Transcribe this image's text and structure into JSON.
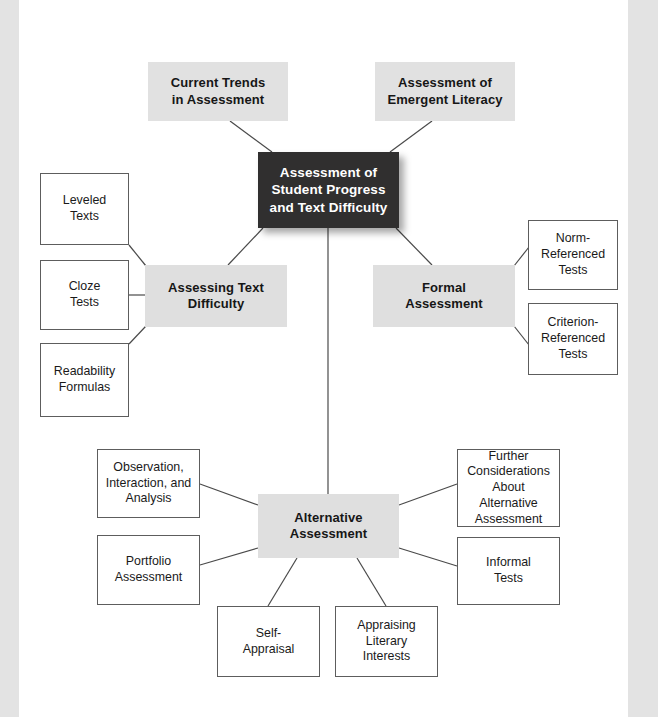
{
  "diagram": {
    "type": "concept-map",
    "colors": {
      "root_fill": "#302f2f",
      "root_text": "#ffffff",
      "hub_fill": "#dfdfdf",
      "top_fill": "#e1e1e1",
      "leaf_fill": "#ffffff",
      "leaf_border": "#5d5d5d",
      "connector": "#4a4a4a",
      "page_edge": "#e3e3e3"
    },
    "nodes": {
      "root": {
        "label": "Assessment of\nStudent Progress\nand Text Difficulty",
        "x": 258,
        "y": 152,
        "w": 141,
        "h": 76
      },
      "current_trends": {
        "label": "Current Trends\nin Assessment",
        "x": 148,
        "y": 62,
        "w": 140,
        "h": 59
      },
      "emergent_literacy": {
        "label": "Assessment of\nEmergent Literacy",
        "x": 375,
        "y": 62,
        "w": 140,
        "h": 59
      },
      "assessing_text_difficulty": {
        "label": "Assessing Text\nDifficulty",
        "x": 145,
        "y": 265,
        "w": 142,
        "h": 62
      },
      "formal_assessment": {
        "label": "Formal\nAssessment",
        "x": 373,
        "y": 265,
        "w": 142,
        "h": 62
      },
      "alternative_assessment": {
        "label": "Alternative\nAssessment",
        "x": 258,
        "y": 494,
        "w": 141,
        "h": 64
      },
      "leveled_texts": {
        "label": "Leveled\nTexts",
        "x": 40,
        "y": 173,
        "w": 89,
        "h": 72
      },
      "cloze_tests": {
        "label": "Cloze\nTests",
        "x": 40,
        "y": 260,
        "w": 89,
        "h": 70
      },
      "readability_formulas": {
        "label": "Readability\nFormulas",
        "x": 40,
        "y": 343,
        "w": 89,
        "h": 74
      },
      "norm_referenced_tests": {
        "label": "Norm-\nReferenced\nTests",
        "x": 528,
        "y": 220,
        "w": 90,
        "h": 70
      },
      "criterion_referenced_tests": {
        "label": "Criterion-\nReferenced\nTests",
        "x": 528,
        "y": 303,
        "w": 90,
        "h": 72
      },
      "observation_interaction_analysis": {
        "label": "Observation,\nInteraction, and\nAnalysis",
        "x": 97,
        "y": 449,
        "w": 103,
        "h": 69
      },
      "portfolio_assessment": {
        "label": "Portfolio\nAssessment",
        "x": 97,
        "y": 535,
        "w": 103,
        "h": 70
      },
      "self_appraisal": {
        "label": "Self-\nAppraisal",
        "x": 217,
        "y": 606,
        "w": 103,
        "h": 71
      },
      "appraising_literary_interests": {
        "label": "Appraising\nLiterary\nInterests",
        "x": 335,
        "y": 606,
        "w": 103,
        "h": 71
      },
      "further_considerations": {
        "label": "Further\nConsiderations\nAbout Alternative\nAssessment",
        "x": 457,
        "y": 449,
        "w": 103,
        "h": 78
      },
      "informal_tests": {
        "label": "Informal\nTests",
        "x": 457,
        "y": 537,
        "w": 103,
        "h": 68
      }
    },
    "edges": [
      {
        "from": "current_trends",
        "to": "root",
        "x1": 230,
        "y1": 121,
        "x2": 272,
        "y2": 152
      },
      {
        "from": "emergent_literacy",
        "to": "root",
        "x1": 432,
        "y1": 121,
        "x2": 390,
        "y2": 152
      },
      {
        "from": "root",
        "to": "assessing_text_difficulty",
        "x1": 263,
        "y1": 228,
        "x2": 228,
        "y2": 265
      },
      {
        "from": "root",
        "to": "formal_assessment",
        "x1": 396,
        "y1": 228,
        "x2": 432,
        "y2": 265
      },
      {
        "from": "root",
        "to": "alternative_assessment",
        "x1": 328,
        "y1": 228,
        "x2": 328,
        "y2": 494
      },
      {
        "from": "leveled_texts",
        "to": "assessing_text_difficulty",
        "x1": 129,
        "y1": 245,
        "x2": 146,
        "y2": 266
      },
      {
        "from": "cloze_tests",
        "to": "assessing_text_difficulty",
        "x1": 129,
        "y1": 295,
        "x2": 146,
        "y2": 295
      },
      {
        "from": "readability_formulas",
        "to": "assessing_text_difficulty",
        "x1": 129,
        "y1": 344,
        "x2": 146,
        "y2": 326
      },
      {
        "from": "formal_assessment",
        "to": "norm_referenced_tests",
        "x1": 514,
        "y1": 266,
        "x2": 529,
        "y2": 247
      },
      {
        "from": "formal_assessment",
        "to": "criterion_referenced_tests",
        "x1": 514,
        "y1": 326,
        "x2": 529,
        "y2": 345
      },
      {
        "from": "observation_interaction_analysis",
        "to": "alternative_assessment",
        "x1": 200,
        "y1": 484,
        "x2": 258,
        "y2": 505
      },
      {
        "from": "portfolio_assessment",
        "to": "alternative_assessment",
        "x1": 200,
        "y1": 565,
        "x2": 258,
        "y2": 548
      },
      {
        "from": "alternative_assessment",
        "to": "self_appraisal",
        "x1": 297,
        "y1": 558,
        "x2": 268,
        "y2": 606
      },
      {
        "from": "alternative_assessment",
        "to": "appraising_literary_interests",
        "x1": 357,
        "y1": 558,
        "x2": 386,
        "y2": 606
      },
      {
        "from": "alternative_assessment",
        "to": "further_considerations",
        "x1": 399,
        "y1": 505,
        "x2": 457,
        "y2": 484
      },
      {
        "from": "alternative_assessment",
        "to": "informal_tests",
        "x1": 399,
        "y1": 548,
        "x2": 457,
        "y2": 566
      }
    ]
  }
}
